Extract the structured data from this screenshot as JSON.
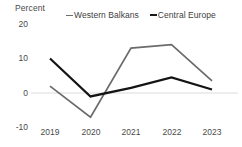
{
  "chart_data": {
    "type": "line",
    "title": "",
    "xlabel": "",
    "ylabel": "Percent",
    "categories": [
      "2019",
      "2020",
      "2021",
      "2022",
      "2023"
    ],
    "ylim": [
      -10,
      20
    ],
    "yticks": [
      20,
      10,
      0,
      -10
    ],
    "ytick_labels": [
      "20",
      "10",
      "0",
      "-10"
    ],
    "grid": false,
    "zero_line": true,
    "legend_position": "top",
    "series": [
      {
        "name": "Western Balkans",
        "color": "#6b6b6b",
        "values": [
          2,
          -7,
          13,
          14,
          3.5
        ]
      },
      {
        "name": "Central Europe",
        "color": "#141414",
        "values": [
          10,
          -1,
          1.5,
          4.5,
          1
        ]
      }
    ]
  },
  "axis": {
    "y_title": "Percent",
    "y_tick_0": "20",
    "y_tick_1": "10",
    "y_tick_2": "0",
    "y_tick_3": "-10",
    "x_tick_0": "2019",
    "x_tick_1": "2020",
    "x_tick_2": "2021",
    "x_tick_3": "2022",
    "x_tick_4": "2023"
  },
  "legend": {
    "item_0": "Western Balkans",
    "item_1": "Central Europe"
  }
}
